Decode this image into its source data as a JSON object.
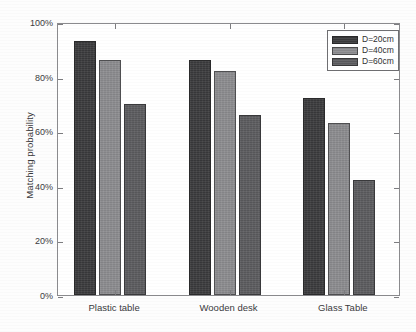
{
  "chart_data": {
    "type": "bar",
    "title": "",
    "xlabel": "",
    "ylabel": "Matching probability",
    "categories": [
      "Plastic table",
      "Wooden desk",
      "Glass Table"
    ],
    "series": [
      {
        "name": "D=20cm",
        "color": "#3b3b3d",
        "values": [
          93,
          86,
          72
        ]
      },
      {
        "name": "D=40cm",
        "color": "#8d8d90",
        "values": [
          86,
          82,
          63
        ]
      },
      {
        "name": "D=60cm",
        "color": "#5c5c5f",
        "values": [
          70,
          66,
          42
        ]
      }
    ],
    "ylim": [
      0,
      100
    ],
    "ytick_values": [
      0,
      20,
      40,
      60,
      80,
      100
    ],
    "ytick_labels": [
      "0%",
      "20%",
      "40%",
      "60%",
      "80%",
      "100%"
    ],
    "grid": false,
    "legend_position": "top-right",
    "axis_box": true
  },
  "legend": {
    "entries": [
      {
        "label": "D=20cm"
      },
      {
        "label": "D=40cm"
      },
      {
        "label": "D=60cm"
      }
    ]
  }
}
